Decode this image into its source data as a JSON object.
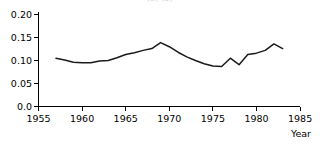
{
  "figure": {
    "clipped_title": "(a)                              (b)",
    "background_color": "#ffffff",
    "line_color": "#1a1a1a",
    "axis_color": "#000000"
  },
  "axes": {
    "x_axis_title": "Year",
    "y_tick_labels": [
      "0.20",
      "0.15",
      "0.10",
      "0.05",
      "0.0"
    ],
    "x_tick_labels": [
      "1955",
      "1960",
      "1965",
      "1970",
      "1975",
      "1980",
      "1985"
    ]
  },
  "chart_data": {
    "type": "line",
    "title": "",
    "subtitle": "",
    "xlabel": "Year",
    "ylabel": "",
    "xlim": [
      1955,
      1985
    ],
    "ylim": [
      0.0,
      0.2
    ],
    "xticks": [
      1955,
      1960,
      1965,
      1970,
      1975,
      1980,
      1985
    ],
    "yticks": [
      0.0,
      0.05,
      0.1,
      0.15,
      0.2
    ],
    "grid": false,
    "legend": null,
    "x": [
      1957,
      1958,
      1959,
      1960,
      1961,
      1962,
      1963,
      1964,
      1965,
      1966,
      1967,
      1968,
      1969,
      1970,
      1971,
      1972,
      1973,
      1974,
      1975,
      1976,
      1977,
      1978,
      1979,
      1980,
      1981,
      1982,
      1983
    ],
    "values": [
      0.105,
      0.101,
      0.096,
      0.095,
      0.095,
      0.099,
      0.1,
      0.106,
      0.113,
      0.117,
      0.122,
      0.126,
      0.139,
      0.13,
      0.118,
      0.108,
      0.1,
      0.093,
      0.088,
      0.087,
      0.105,
      0.091,
      0.113,
      0.116,
      0.122,
      0.136,
      0.126
    ],
    "series": [
      {
        "name": "series-1",
        "values": [
          0.105,
          0.101,
          0.096,
          0.095,
          0.095,
          0.099,
          0.1,
          0.106,
          0.113,
          0.117,
          0.122,
          0.126,
          0.139,
          0.13,
          0.118,
          0.108,
          0.1,
          0.093,
          0.088,
          0.087,
          0.105,
          0.091,
          0.113,
          0.116,
          0.122,
          0.136,
          0.126
        ]
      }
    ]
  }
}
